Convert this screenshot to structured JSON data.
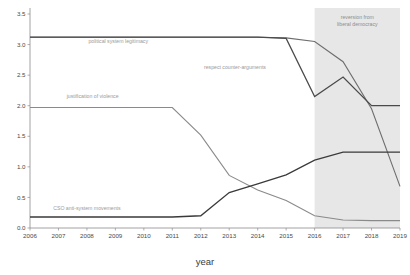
{
  "chart_data": {
    "type": "line",
    "title": "",
    "xlabel": "year",
    "ylabel": "",
    "grid": false,
    "legend_position": "inline-labels",
    "x": [
      2006,
      2007,
      2008,
      2009,
      2010,
      2011,
      2012,
      2013,
      2014,
      2015,
      2016,
      2017,
      2018,
      2019
    ],
    "xlim": [
      2006,
      2019
    ],
    "ylim": [
      0.0,
      3.5
    ],
    "yticks": [
      "0.0",
      "0.5",
      "1.0",
      "1.5",
      "2.0",
      "2.5",
      "3.0",
      "3.5"
    ],
    "ytick_values": [
      0.0,
      0.5,
      1.0,
      1.5,
      2.0,
      2.5,
      3.0,
      3.5
    ],
    "xticks": [
      "2006",
      "2007",
      "2008",
      "2009",
      "2010",
      "2011",
      "2012",
      "2013",
      "2014",
      "2015",
      "2016",
      "2017",
      "2018",
      "2019"
    ],
    "series": [
      {
        "name": "political system legitimacy",
        "label": "political system legitimacy",
        "color": "#6e6e6e",
        "width": 1.1,
        "label_x": 2009.1,
        "label_y": 3.02,
        "values": [
          3.12,
          3.12,
          3.12,
          3.12,
          3.12,
          3.12,
          3.12,
          3.12,
          3.12,
          3.11,
          3.05,
          2.72,
          1.95,
          0.68
        ]
      },
      {
        "name": "respect counter-arguments",
        "label": "respect counter-arguments",
        "color": "#4a4a4a",
        "width": 1.25,
        "label_x": 2013.2,
        "label_y": 2.6,
        "values": [
          3.12,
          3.12,
          3.12,
          3.12,
          3.12,
          3.12,
          3.12,
          3.12,
          3.12,
          3.1,
          2.15,
          2.47,
          2.0,
          2.0
        ]
      },
      {
        "name": "justification of violence",
        "label": "justification of violence",
        "color": "#8a8a8a",
        "width": 1.1,
        "label_x": 2008.2,
        "label_y": 2.12,
        "values": [
          1.97,
          1.97,
          1.97,
          1.97,
          1.97,
          1.97,
          1.52,
          0.86,
          0.62,
          0.45,
          0.2,
          0.13,
          0.12,
          0.12
        ]
      },
      {
        "name": "CSO anti-system movements",
        "label": "CSO anti-system movements",
        "color": "#3a3a3a",
        "width": 1.3,
        "label_x": 2008.0,
        "label_y": 0.3,
        "values": [
          0.18,
          0.18,
          0.18,
          0.18,
          0.18,
          0.18,
          0.2,
          0.58,
          0.72,
          0.87,
          1.11,
          1.24,
          1.24,
          1.24
        ]
      }
    ],
    "annotations": [
      {
        "name": "reversion-shading",
        "text_line1": "reversion from",
        "text_line2": "liberal democracy",
        "x_start": 2016,
        "x_end": 2019,
        "color": "#e3e3e3"
      }
    ]
  }
}
